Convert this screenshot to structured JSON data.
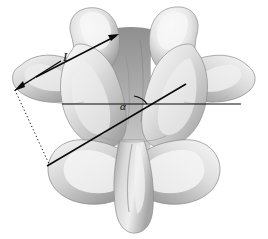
{
  "figure": {
    "background_color": "#ffffff",
    "annotation_color": "#0a0a0a",
    "bone_light": "#f2f2f2",
    "bone_mid": "#c8c8c8",
    "bone_shadow": "#8e8e8e",
    "bone_dark": "#5a5a5a"
  },
  "annotations": {
    "length_label": "L",
    "angle_label": "α"
  },
  "measurements": {
    "length_line": {
      "name": "L",
      "from_x": 36,
      "from_y": 77,
      "to_x": 119,
      "to_y": 34
    },
    "angle_line": {
      "name": "alpha-oblique-line",
      "from_x": 47,
      "from_y": 166,
      "to_x": 186,
      "to_y": 84
    },
    "reference_line": {
      "name": "horizontal-reference",
      "from_x": 62,
      "from_y": 104,
      "to_x": 241,
      "to_y": 104
    },
    "dimension_arrow": {
      "from_x": 60,
      "from_y": 62,
      "to_x": 15,
      "to_y": 90
    },
    "extension_upper": {
      "from_x": 15,
      "from_y": 90,
      "to_x": 36,
      "to_y": 77
    },
    "extension_lower": {
      "from_x": 15,
      "from_y": 90,
      "to_x": 48,
      "to_y": 164
    }
  },
  "anatomy": {
    "parts": [
      "superior-articular-process-left",
      "superior-articular-process-right",
      "transverse-process-left",
      "transverse-process-right",
      "lamina",
      "spinous-process",
      "inferior-articular-process-left",
      "inferior-articular-process-right",
      "vertebral-body"
    ]
  }
}
